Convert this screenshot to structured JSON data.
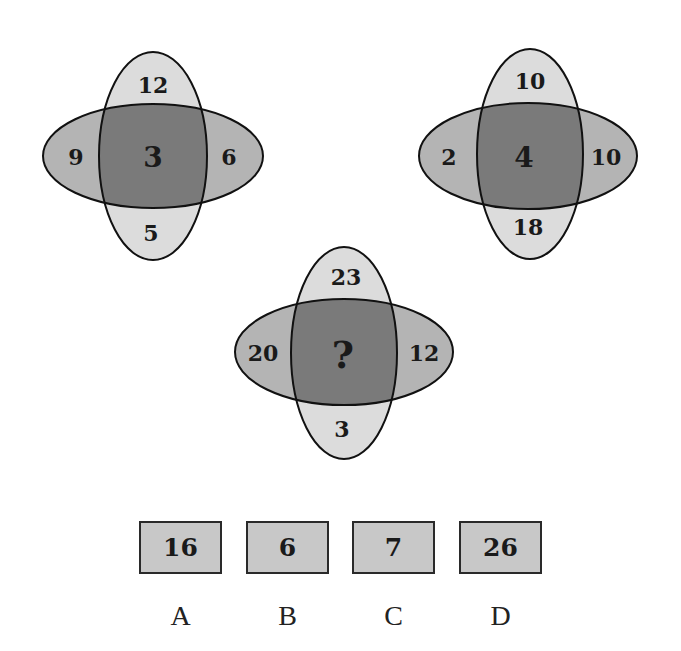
{
  "colors": {
    "vertical_ellipse": "#dcdcdc",
    "horizontal_ellipse": "#b4b4b4",
    "overlap": "#7a7a7a",
    "stroke": "#111111",
    "option_box": "#c8c8c8"
  },
  "diagrams": [
    {
      "top": "12",
      "left": "9",
      "center": "3",
      "right": "6",
      "bottom": "5"
    },
    {
      "top": "10",
      "left": "2",
      "center": "4",
      "right": "10",
      "bottom": "18"
    },
    {
      "top": "23",
      "left": "20",
      "center": "?",
      "right": "12",
      "bottom": "3"
    }
  ],
  "options": [
    {
      "label": "A",
      "value": "16"
    },
    {
      "label": "B",
      "value": "6"
    },
    {
      "label": "C",
      "value": "7"
    },
    {
      "label": "D",
      "value": "26"
    }
  ]
}
